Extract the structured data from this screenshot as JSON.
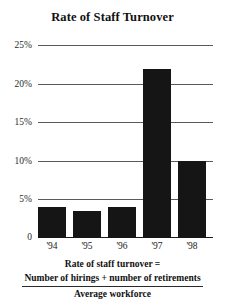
{
  "chart_data": {
    "type": "bar",
    "title": "Rate of Staff Turnover",
    "xlabel": "",
    "ylabel": "",
    "categories": [
      "'94",
      "'95",
      "'96",
      "'97",
      "'98"
    ],
    "values": [
      4,
      3.5,
      4,
      22,
      10
    ],
    "value_labels": [
      "4%",
      "3.5%",
      "4%",
      "22%",
      "10%"
    ],
    "ylim": [
      0,
      25
    ],
    "yticks": [
      0,
      5,
      10,
      15,
      20,
      25
    ],
    "ytick_labels": [
      "0",
      "5%",
      "10%",
      "15%",
      "20%",
      "25%"
    ],
    "grid": true,
    "legend": false,
    "bar_color": "#151515",
    "gridline_color": "#5a5a5a",
    "annotations": {
      "formula_lead": "Rate of staff turnover =",
      "formula_numerator": "Number of hirings + number of retirements",
      "formula_denominator": "Average workforce"
    }
  },
  "caption": {
    "lead": "Rate of staff turnover =",
    "numerator": "Number of hirings + number of retirements",
    "denominator": "Average workforce"
  }
}
